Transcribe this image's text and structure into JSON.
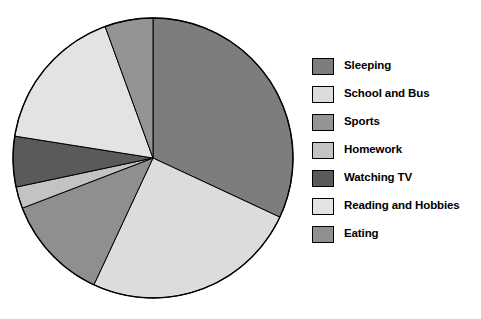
{
  "chart_data": {
    "type": "pie",
    "title": "",
    "subtitle": "",
    "xlabel": "",
    "ylabel": "",
    "legend_position": "right",
    "grid": false,
    "categories": [
      "Sleeping",
      "School and Bus",
      "Sports",
      "Homework",
      "Watching TV",
      "Reading and Hobbies",
      "Eating"
    ],
    "values": [
      32,
      25,
      6,
      2,
      6,
      17,
      12
    ],
    "units": "percent",
    "slices": [
      {
        "label": "Sleeping",
        "value": 32,
        "color": "#7d7d7d",
        "start_angle": 0,
        "end_angle": 115
      },
      {
        "label": "School and Bus",
        "value": 25,
        "color": "#dcdcdc",
        "start_angle": 115,
        "end_angle": 205
      },
      {
        "label": "Eating",
        "value": 12,
        "color": "#8f8f8f",
        "start_angle": 205,
        "end_angle": 249
      },
      {
        "label": "Homework",
        "value": 2,
        "color": "#c3c3c3",
        "start_angle": 249,
        "end_angle": 258
      },
      {
        "label": "Watching TV",
        "value": 6,
        "color": "#5a5a5a",
        "start_angle": 258,
        "end_angle": 279
      },
      {
        "label": "Reading and Hobbies",
        "value": 17,
        "color": "#e3e3e3",
        "start_angle": 279,
        "end_angle": 340
      },
      {
        "label": "Sports",
        "value": 6,
        "color": "#949494",
        "start_angle": 340,
        "end_angle": 360
      }
    ],
    "geometry": {
      "cx": 153,
      "cy": 158,
      "r": 140
    },
    "stroke": "#000000"
  },
  "legend": {
    "items": [
      {
        "label": "Sleeping",
        "color": "#7d7d7d"
      },
      {
        "label": "School and Bus",
        "color": "#dcdcdc"
      },
      {
        "label": "Sports",
        "color": "#949494"
      },
      {
        "label": "Homework",
        "color": "#c3c3c3"
      },
      {
        "label": "Watching TV",
        "color": "#5a5a5a"
      },
      {
        "label": "Reading and Hobbies",
        "color": "#e3e3e3"
      },
      {
        "label": "Eating",
        "color": "#8f8f8f"
      }
    ]
  }
}
